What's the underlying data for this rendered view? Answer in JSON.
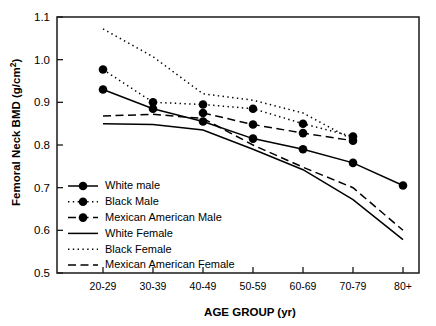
{
  "chart_data": {
    "type": "line",
    "title": "",
    "xlabel": "AGE GROUP (yr)",
    "ylabel": "Femoral Neck BMD (g/cm2)",
    "ylabel_main": "Femoral Neck BMD (g/cm",
    "ylabel_sup": "2",
    "ylabel_tail": ")",
    "categories": [
      "20-29",
      "30-39",
      "40-49",
      "50-59",
      "60-69",
      "70-79",
      "80+"
    ],
    "ylim": [
      0.5,
      1.1
    ],
    "ytick_labels": [
      "1.1",
      "1.0",
      "0.9",
      "0.8",
      "0.7",
      "0.6",
      "0.5"
    ],
    "ytick_values": [
      1.1,
      1.0,
      0.9,
      0.8,
      0.7,
      0.6,
      0.5
    ],
    "grid": false,
    "legend_position": "lower-left-inside",
    "series": [
      {
        "name": "White male",
        "style": "solid-marker",
        "values": [
          0.93,
          0.885,
          0.855,
          0.815,
          0.79,
          0.758,
          0.705
        ]
      },
      {
        "name": "Black Male",
        "style": "dotted-marker",
        "values": [
          0.977,
          0.9,
          0.895,
          0.885,
          0.85,
          0.82,
          null
        ]
      },
      {
        "name": "Mexican American Male",
        "style": "dashed-marker",
        "values": [
          null,
          null,
          0.875,
          0.848,
          0.828,
          0.81,
          null
        ]
      },
      {
        "name": "White Female",
        "style": "solid",
        "values": [
          0.85,
          0.848,
          0.835,
          0.79,
          0.742,
          0.672,
          0.578
        ]
      },
      {
        "name": "Black Female",
        "style": "dotted",
        "values": [
          1.072,
          1.007,
          0.92,
          0.905,
          0.875,
          0.812,
          null
        ]
      },
      {
        "name": "Mexican American Female",
        "style": "dashed",
        "values": [
          0.868,
          0.872,
          0.862,
          0.8,
          0.748,
          0.7,
          0.6
        ]
      }
    ],
    "legend": [
      {
        "label": "White male",
        "style": "solid-marker"
      },
      {
        "label": "Black Male",
        "style": "dotted-marker"
      },
      {
        "label": "Mexican American Male",
        "style": "dashed-marker"
      },
      {
        "label": "White Female",
        "style": "solid"
      },
      {
        "label": "Black Female",
        "style": "dotted"
      },
      {
        "label": "Mexican American Female",
        "style": "dashed"
      }
    ]
  }
}
